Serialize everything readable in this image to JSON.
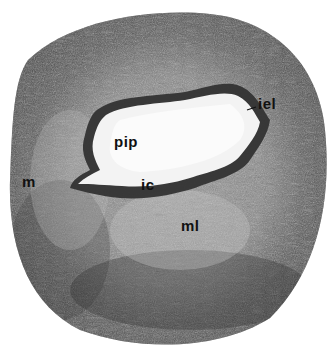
{
  "image": {
    "type": "histology-micrograph",
    "subject": "artery cross-section",
    "colors": {
      "background": "#ffffff",
      "wall_dark": "#3a3a3a",
      "wall_mid": "#7a7a7a",
      "wall_light": "#b8b8b8",
      "lumen": "#f4f4f4",
      "lining": "#2a2a2a",
      "label_text": "#111111"
    }
  },
  "labels": [
    {
      "id": "iel",
      "text": "iel",
      "x": 258,
      "y": 103
    },
    {
      "id": "pip",
      "text": "pip",
      "x": 116,
      "y": 141
    },
    {
      "id": "ic",
      "text": "ic",
      "x": 141,
      "y": 184
    },
    {
      "id": "m",
      "text": "m",
      "x": 23,
      "y": 181
    },
    {
      "id": "ml",
      "text": "ml",
      "x": 181,
      "y": 225
    }
  ]
}
